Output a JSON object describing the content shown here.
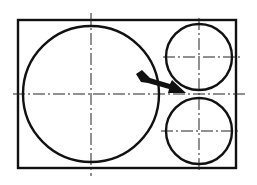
{
  "diagram": {
    "type": "technical-drawing",
    "colors": {
      "line": "#111111",
      "background": "#ffffff"
    },
    "frame": {
      "x": 18,
      "y": 20,
      "width": 218,
      "height": 148
    },
    "circles": [
      {
        "id": "large",
        "cx": 91,
        "cy": 94,
        "r": 68
      },
      {
        "id": "small-top",
        "cx": 199,
        "cy": 57,
        "r": 33
      },
      {
        "id": "small-bottom",
        "cx": 199,
        "cy": 131,
        "r": 33
      }
    ],
    "centerlines": [
      {
        "id": "main-horizontal",
        "x1": 13,
        "y1": 94,
        "x2": 247,
        "y2": 94
      },
      {
        "id": "large-vertical",
        "x1": 91,
        "y1": 13,
        "x2": 91,
        "y2": 176
      },
      {
        "id": "small-vertical",
        "x1": 199,
        "y1": 18,
        "x2": 199,
        "y2": 172
      },
      {
        "id": "small-top-horizontal",
        "x1": 163,
        "y1": 57,
        "x2": 240,
        "y2": 57
      },
      {
        "id": "small-bottom-horizontal",
        "x1": 161,
        "y1": 131,
        "x2": 241,
        "y2": 131
      }
    ],
    "arrow": {
      "from": [
        136,
        76
      ],
      "to": [
        185,
        93
      ],
      "icon": "arrow-right-down-icon"
    }
  }
}
